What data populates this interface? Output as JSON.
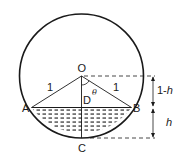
{
  "diagram": {
    "points": {
      "O": "O",
      "A": "A",
      "B": "B",
      "C": "C",
      "D": "D"
    },
    "radius_labels": {
      "OA": "1",
      "OB": "1"
    },
    "angle_label": "θ",
    "dimensions": {
      "upper_prefix": "1-",
      "upper_var": "h",
      "lower": "h"
    },
    "colors": {
      "stroke": "#1a1a1a",
      "background": "#ffffff"
    }
  }
}
